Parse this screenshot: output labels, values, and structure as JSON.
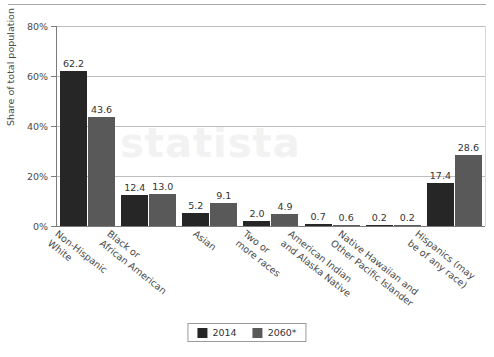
{
  "watermark_text": "statista",
  "chart_data": {
    "type": "bar",
    "title": "",
    "subtitle": "",
    "xlabel": "",
    "ylabel": "Share of total population",
    "ylim": [
      0,
      80
    ],
    "ytick_labels": [
      "0%",
      "20%",
      "40%",
      "60%",
      "80%"
    ],
    "ytick_values": [
      0,
      20,
      40,
      60,
      80
    ],
    "grid": "horizontal",
    "legend_position": "bottom-center",
    "value_suffix": "",
    "categories": [
      "Non-Hispanic\nWhite",
      "Black or\nAfrican American",
      "Asian",
      "Two or\nmore races",
      "American Indian\nand Alaska Native",
      "Native Hawaiian and\nOther Pacific Islander",
      "Hispanics (may\nbe of any race)"
    ],
    "series": [
      {
        "name": "2014",
        "color": "#262626",
        "values": [
          62.2,
          12.4,
          5.2,
          2.0,
          0.7,
          0.2,
          17.4
        ],
        "labels": [
          "62.2",
          "12.4",
          "5.2",
          "2.0",
          "0.7",
          "0.2",
          "17.4"
        ]
      },
      {
        "name": "2060*",
        "color": "#595959",
        "values": [
          43.6,
          13.0,
          9.1,
          4.9,
          0.6,
          0.2,
          28.6
        ],
        "labels": [
          "43.6",
          "13.0",
          "9.1",
          "4.9",
          "0.6",
          "0.2",
          "28.6"
        ]
      }
    ],
    "legend": [
      "2014",
      "2060*"
    ]
  }
}
